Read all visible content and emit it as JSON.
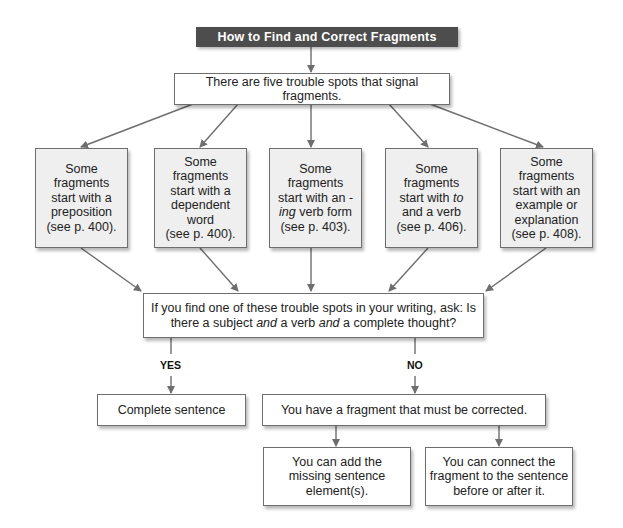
{
  "title": "How to Find and Correct Fragments",
  "intro": "There are five trouble spots that signal fragments.",
  "trouble_spots": [
    {
      "lines": [
        "Some",
        "fragments",
        "start with a",
        "preposition",
        "(see p. 400)."
      ]
    },
    {
      "lines": [
        "Some",
        "fragments",
        "start with a",
        "dependent",
        "word",
        "(see p. 400)."
      ]
    },
    {
      "lines_html": true,
      "pre": "Some fragments start with an",
      "em": "-ing",
      "post": "verb form",
      "page": "(see p. 403)."
    },
    {
      "lines_html": true,
      "pre": "Some fragments start with",
      "em": "to",
      "post": "and a verb",
      "page": "(see p. 406)."
    },
    {
      "lines": [
        "Some",
        "fragments",
        "start with an",
        "example or",
        "explanation",
        "(see p. 408)."
      ]
    }
  ],
  "question": {
    "line1": "If you find one of these trouble spots in your writing, ask: Is",
    "l2a": "there a subject",
    "and1": "and",
    "l2b": "a verb",
    "and2": "and",
    "l2c": "a complete thought?"
  },
  "branches": {
    "yes_label": "YES",
    "no_label": "NO"
  },
  "yes_result": "Complete sentence",
  "no_result": "You have a fragment that must be corrected.",
  "fixes": [
    {
      "lines": [
        "You can add the",
        "missing sentence",
        "element(s)."
      ]
    },
    {
      "lines": [
        "You can connect the",
        "fragment to the sentence",
        "before or after it."
      ]
    }
  ],
  "colors": {
    "title_bg": "#4d4d4d",
    "box_fill_gray": "#efefef",
    "box_border": "#6e6e6e",
    "connector": "#6e6e6e"
  }
}
